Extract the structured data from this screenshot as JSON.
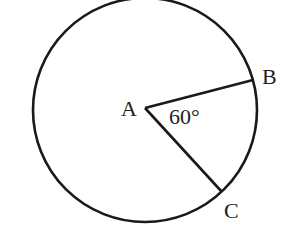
{
  "diagram": {
    "type": "circle-with-central-angle",
    "colors": {
      "stroke": "#1a1a1a",
      "text": "#222222",
      "background": "#ffffff"
    },
    "circle": {
      "cx": 145,
      "cy": 110,
      "r": 112
    },
    "points": {
      "A": {
        "label": "A",
        "x": 145,
        "y": 108,
        "label_x": 121,
        "label_y": 116,
        "role": "center"
      },
      "B": {
        "label": "B",
        "x": 253,
        "y": 80,
        "label_x": 262,
        "label_y": 84,
        "role": "on circle"
      },
      "C": {
        "label": "C",
        "x": 222,
        "y": 192,
        "label_x": 224,
        "label_y": 218,
        "role": "on circle"
      }
    },
    "segments": [
      {
        "from": "A",
        "to": "B"
      },
      {
        "from": "A",
        "to": "C"
      }
    ],
    "angle": {
      "vertex": "A",
      "between": [
        "B",
        "C"
      ],
      "label": "60°",
      "label_x": 169,
      "label_y": 124
    }
  }
}
